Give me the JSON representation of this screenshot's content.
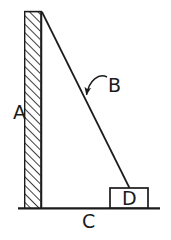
{
  "figure": {
    "background_color": "#ffffff",
    "stroke_color": "#1b1b1b",
    "labels": {
      "wall": "A",
      "ladder": "B",
      "ground": "C",
      "block": "D"
    },
    "elements": {
      "wall": {
        "name": "hatched-vertical-wall",
        "x": 24,
        "y": 11,
        "width": 18,
        "height": 197,
        "hatch": "diagonal-45"
      },
      "ground": {
        "name": "ground-line",
        "x1": 18,
        "y1": 208,
        "x2": 160,
        "y2": 208
      },
      "ladder": {
        "name": "ladder-line",
        "x1": 42,
        "y1": 12,
        "x2": 130,
        "y2": 189
      },
      "block": {
        "name": "block-rectangle",
        "x": 110,
        "y": 188,
        "width": 38,
        "height": 20
      },
      "leader": {
        "name": "curved-leader-arrow",
        "from_x": 107,
        "from_y": 77,
        "to_x": 86,
        "to_y": 96
      }
    },
    "label_positions": {
      "wall": {
        "x": 13,
        "y": 119
      },
      "ladder": {
        "x": 108,
        "y": 92
      },
      "ground": {
        "x": 82,
        "y": 228
      },
      "block": {
        "x": 122,
        "y": 205
      }
    }
  }
}
